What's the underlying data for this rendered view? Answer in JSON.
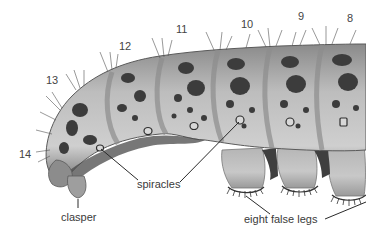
{
  "figure": {
    "colors": {
      "body_light": "#c9c9c9",
      "body_mid": "#a8a8a8",
      "body_dark": "#6e6e6e",
      "spots": "#3c3c3c",
      "label_text": "#3a3a3a",
      "leader_line": "#2a2a2a",
      "background": "#ffffff"
    },
    "segment_numbers": [
      {
        "label": "8",
        "x": 347,
        "y": 13
      },
      {
        "label": "9",
        "x": 298,
        "y": 11
      },
      {
        "label": "10",
        "x": 241,
        "y": 19
      },
      {
        "label": "11",
        "x": 176,
        "y": 24
      },
      {
        "label": "12",
        "x": 119,
        "y": 41
      },
      {
        "label": "13",
        "x": 46,
        "y": 75
      },
      {
        "label": "14",
        "x": 19,
        "y": 149
      }
    ],
    "labels": {
      "spiracles": "spiracles",
      "clasper": "clasper",
      "false_legs": "eight false legs"
    }
  }
}
